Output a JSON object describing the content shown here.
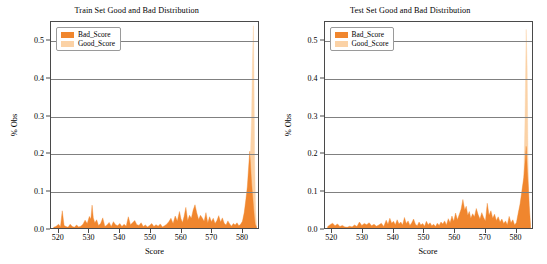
{
  "figure": {
    "width": 547,
    "height": 264,
    "background": "#ffffff"
  },
  "colors": {
    "bad_score": "#f0862e",
    "good_score": "#fbd2a6",
    "grid": "#808080",
    "axis": "#4a4a4a",
    "text": "#000000"
  },
  "panels": [
    {
      "id": "train",
      "title": "Train Set Good and Bad Distribution",
      "legend": {
        "bad_label": "Bad_Score",
        "good_label": "Good_Score"
      },
      "xlabel": "Score",
      "ylabel": "% Obs",
      "xticks": [
        "520",
        "530",
        "540",
        "550",
        "560",
        "570",
        "580"
      ],
      "yticks": [
        "0.0",
        "0.1",
        "0.2",
        "0.3",
        "0.4",
        "0.5"
      ]
    },
    {
      "id": "test",
      "title": "Test Set Good and Bad Distribution",
      "legend": {
        "bad_label": "Bad_Score",
        "good_label": "Good_Score"
      },
      "xlabel": "Score",
      "ylabel": "% Obs",
      "xticks": [
        "520",
        "530",
        "540",
        "550",
        "560",
        "570",
        "580"
      ],
      "yticks": [
        "0.0",
        "0.1",
        "0.2",
        "0.3",
        "0.4",
        "0.5"
      ]
    }
  ],
  "chart_data": [
    {
      "type": "line",
      "id": "train",
      "title": "Train Set Good and Bad Distribution",
      "xlabel": "Score",
      "ylabel": "% Obs",
      "xlim": [
        517.5,
        585.5
      ],
      "ylim": [
        0.0,
        0.55
      ],
      "grid": true,
      "grid_axis": "y",
      "legend_position": "upper left",
      "yticks": [
        0.0,
        0.1,
        0.2,
        0.3,
        0.4,
        0.5
      ],
      "xticks": [
        520,
        530,
        540,
        550,
        560,
        570,
        580
      ],
      "series": [
        {
          "name": "Bad_Score",
          "color": "#f0862e",
          "x": [
            518.4,
            519.1,
            520.0,
            520.6,
            521.2,
            521.8,
            522.4,
            523.1,
            523.8,
            524.5,
            525.2,
            525.9,
            526.6,
            527.3,
            528.0,
            528.7,
            529.4,
            530.1,
            530.6,
            531.0,
            531.4,
            531.9,
            532.5,
            533.1,
            533.8,
            534.5,
            535.2,
            535.9,
            536.6,
            537.3,
            538.0,
            538.7,
            539.4,
            540.1,
            540.8,
            541.5,
            542.2,
            542.9,
            543.6,
            544.3,
            545.0,
            545.7,
            546.4,
            547.1,
            547.8,
            548.5,
            549.2,
            549.9,
            550.6,
            551.3,
            552.0,
            552.7,
            553.4,
            554.1,
            554.8,
            555.5,
            556.2,
            556.9,
            557.6,
            558.3,
            559.0,
            559.7,
            560.2,
            560.7,
            561.2,
            561.8,
            562.4,
            563.0,
            563.6,
            564.2,
            564.8,
            565.4,
            566.0,
            566.6,
            567.2,
            567.8,
            568.4,
            569.0,
            569.6,
            570.2,
            570.8,
            571.4,
            572.0,
            572.6,
            573.2,
            573.8,
            574.4,
            575.0,
            575.6,
            576.2,
            576.8,
            577.4,
            578.0,
            578.6,
            579.2,
            579.8,
            580.4,
            581.0,
            581.5,
            582.0,
            582.4,
            582.8,
            583.1,
            583.4,
            583.7,
            584.0,
            584.3,
            584.6,
            585.0
          ],
          "y": [
            0.002,
            0.004,
            0.01,
            0.003,
            0.046,
            0.007,
            0.004,
            0.002,
            0.01,
            0.004,
            0.002,
            0.008,
            0.003,
            0.005,
            0.01,
            0.021,
            0.012,
            0.031,
            0.024,
            0.061,
            0.027,
            0.014,
            0.022,
            0.007,
            0.012,
            0.027,
            0.004,
            0.008,
            0.015,
            0.004,
            0.017,
            0.009,
            0.006,
            0.012,
            0.004,
            0.01,
            0.005,
            0.03,
            0.009,
            0.014,
            0.02,
            0.009,
            0.007,
            0.014,
            0.004,
            0.008,
            0.003,
            0.007,
            0.012,
            0.004,
            0.009,
            0.005,
            0.011,
            0.003,
            0.006,
            0.01,
            0.017,
            0.026,
            0.012,
            0.032,
            0.019,
            0.044,
            0.025,
            0.015,
            0.03,
            0.055,
            0.02,
            0.034,
            0.026,
            0.048,
            0.062,
            0.04,
            0.023,
            0.034,
            0.027,
            0.018,
            0.041,
            0.014,
            0.03,
            0.017,
            0.026,
            0.012,
            0.02,
            0.033,
            0.016,
            0.027,
            0.013,
            0.008,
            0.019,
            0.011,
            0.005,
            0.012,
            0.008,
            0.014,
            0.006,
            0.01,
            0.018,
            0.042,
            0.075,
            0.11,
            0.16,
            0.205,
            0.16,
            0.12,
            0.09,
            0.06,
            0.03,
            0.01,
            0.003
          ]
        },
        {
          "name": "Good_Score",
          "color": "#fbd2a6",
          "x": [
            518.4,
            519.1,
            520.0,
            520.6,
            521.2,
            521.8,
            522.4,
            523.1,
            523.8,
            524.5,
            525.2,
            525.9,
            526.6,
            527.3,
            528.0,
            528.7,
            529.4,
            530.1,
            530.6,
            531.0,
            531.4,
            531.9,
            532.5,
            533.1,
            533.8,
            534.5,
            535.2,
            535.9,
            536.6,
            537.3,
            538.0,
            538.7,
            539.4,
            540.1,
            540.8,
            541.5,
            542.2,
            542.9,
            543.6,
            544.3,
            545.0,
            545.7,
            546.4,
            547.1,
            547.8,
            548.5,
            549.2,
            549.9,
            550.6,
            551.3,
            552.0,
            552.7,
            553.4,
            554.1,
            554.8,
            555.5,
            556.2,
            556.9,
            557.6,
            558.3,
            559.0,
            559.7,
            560.2,
            560.7,
            561.2,
            561.8,
            562.4,
            563.0,
            563.6,
            564.2,
            564.8,
            565.4,
            566.0,
            566.6,
            567.2,
            567.8,
            568.4,
            569.0,
            569.6,
            570.2,
            570.8,
            571.4,
            572.0,
            572.6,
            573.2,
            573.8,
            574.4,
            575.0,
            575.6,
            576.2,
            576.8,
            577.4,
            578.0,
            578.6,
            579.2,
            579.8,
            580.4,
            581.0,
            581.6,
            582.1,
            582.6,
            583.0,
            583.4,
            583.7,
            584.0,
            584.2,
            584.4,
            584.7,
            585.0
          ],
          "y": [
            0.001,
            0.002,
            0.005,
            0.002,
            0.018,
            0.004,
            0.002,
            0.001,
            0.005,
            0.002,
            0.001,
            0.004,
            0.002,
            0.003,
            0.005,
            0.009,
            0.006,
            0.013,
            0.01,
            0.022,
            0.011,
            0.007,
            0.009,
            0.004,
            0.006,
            0.011,
            0.002,
            0.004,
            0.007,
            0.002,
            0.008,
            0.004,
            0.003,
            0.006,
            0.002,
            0.005,
            0.003,
            0.012,
            0.004,
            0.007,
            0.009,
            0.004,
            0.003,
            0.007,
            0.002,
            0.004,
            0.002,
            0.003,
            0.006,
            0.002,
            0.004,
            0.003,
            0.005,
            0.002,
            0.003,
            0.005,
            0.008,
            0.012,
            0.006,
            0.015,
            0.009,
            0.02,
            0.012,
            0.008,
            0.014,
            0.024,
            0.01,
            0.016,
            0.012,
            0.021,
            0.028,
            0.018,
            0.011,
            0.016,
            0.013,
            0.009,
            0.019,
            0.007,
            0.014,
            0.009,
            0.013,
            0.007,
            0.011,
            0.017,
            0.009,
            0.014,
            0.008,
            0.005,
            0.011,
            0.007,
            0.004,
            0.008,
            0.006,
            0.01,
            0.005,
            0.009,
            0.016,
            0.038,
            0.07,
            0.105,
            0.145,
            0.19,
            0.3,
            0.45,
            0.54,
            0.38,
            0.18,
            0.05,
            0.005
          ]
        }
      ],
      "annotations": [
        "Tall narrow spike near score 584 exceeding the 0.5 axis limit",
        "Secondary peak around 0.21 near score 583",
        "Low sparse activity below 0.07 across 518-580"
      ]
    },
    {
      "type": "line",
      "id": "test",
      "title": "Test Set Good and Bad Distribution",
      "xlabel": "Score",
      "ylabel": "% Obs",
      "xlim": [
        517.5,
        585.5
      ],
      "ylim": [
        0.0,
        0.55
      ],
      "grid": true,
      "grid_axis": "y",
      "legend_position": "upper left",
      "yticks": [
        0.0,
        0.1,
        0.2,
        0.3,
        0.4,
        0.5
      ],
      "xticks": [
        520,
        530,
        540,
        550,
        560,
        570,
        580
      ],
      "series": [
        {
          "name": "Bad_Score",
          "color": "#f0862e",
          "x": [
            518.4,
            519.2,
            520.0,
            520.8,
            521.6,
            522.4,
            523.2,
            524.0,
            524.8,
            525.6,
            526.4,
            527.2,
            528.0,
            528.8,
            529.6,
            530.4,
            531.2,
            532.0,
            532.8,
            533.6,
            534.4,
            535.2,
            536.0,
            536.8,
            537.6,
            538.2,
            538.8,
            539.4,
            540.0,
            540.6,
            541.2,
            541.8,
            542.4,
            543.0,
            543.6,
            544.2,
            544.8,
            545.4,
            546.0,
            546.6,
            547.2,
            547.8,
            548.4,
            549.0,
            549.6,
            550.2,
            550.8,
            551.4,
            552.0,
            552.6,
            553.2,
            553.8,
            554.4,
            555.0,
            555.6,
            556.2,
            556.8,
            557.4,
            558.0,
            558.6,
            559.2,
            559.8,
            560.4,
            561.0,
            561.6,
            562.2,
            562.8,
            563.4,
            563.9,
            564.4,
            564.9,
            565.4,
            566.0,
            566.6,
            567.2,
            567.8,
            568.4,
            569.0,
            569.6,
            570.2,
            570.8,
            571.4,
            572.0,
            572.6,
            573.2,
            573.8,
            574.4,
            575.0,
            575.6,
            576.2,
            576.8,
            577.4,
            578.0,
            578.6,
            579.2,
            579.8,
            580.4,
            581.0,
            581.6,
            582.2,
            582.8,
            583.2,
            583.6,
            584.0,
            584.3,
            584.6,
            585.0
          ],
          "y": [
            0.004,
            0.009,
            0.013,
            0.006,
            0.011,
            0.004,
            0.007,
            0.003,
            0.002,
            0.005,
            0.003,
            0.008,
            0.004,
            0.016,
            0.007,
            0.012,
            0.009,
            0.014,
            0.006,
            0.01,
            0.005,
            0.008,
            0.013,
            0.004,
            0.021,
            0.01,
            0.026,
            0.013,
            0.018,
            0.009,
            0.022,
            0.011,
            0.016,
            0.008,
            0.028,
            0.012,
            0.019,
            0.007,
            0.014,
            0.024,
            0.01,
            0.006,
            0.016,
            0.008,
            0.012,
            0.005,
            0.018,
            0.009,
            0.014,
            0.006,
            0.01,
            0.004,
            0.013,
            0.007,
            0.016,
            0.011,
            0.019,
            0.008,
            0.025,
            0.014,
            0.032,
            0.018,
            0.04,
            0.022,
            0.036,
            0.05,
            0.076,
            0.048,
            0.058,
            0.034,
            0.044,
            0.026,
            0.038,
            0.03,
            0.052,
            0.036,
            0.024,
            0.041,
            0.028,
            0.019,
            0.066,
            0.034,
            0.046,
            0.026,
            0.037,
            0.02,
            0.03,
            0.016,
            0.024,
            0.012,
            0.019,
            0.009,
            0.031,
            0.014,
            0.022,
            0.008,
            0.015,
            0.041,
            0.065,
            0.1,
            0.135,
            0.175,
            0.218,
            0.15,
            0.11,
            0.06,
            0.01
          ]
        },
        {
          "name": "Good_Score",
          "color": "#fbd2a6",
          "x": [
            518.4,
            519.2,
            520.0,
            520.8,
            521.6,
            522.4,
            523.2,
            524.0,
            524.8,
            525.6,
            526.4,
            527.2,
            528.0,
            528.8,
            529.6,
            530.4,
            531.2,
            532.0,
            532.8,
            533.6,
            534.4,
            535.2,
            536.0,
            536.8,
            537.6,
            538.2,
            538.8,
            539.4,
            540.0,
            540.6,
            541.2,
            541.8,
            542.4,
            543.0,
            543.6,
            544.2,
            544.8,
            545.4,
            546.0,
            546.6,
            547.2,
            547.8,
            548.4,
            549.0,
            549.6,
            550.2,
            550.8,
            551.4,
            552.0,
            552.6,
            553.2,
            553.8,
            554.4,
            555.0,
            555.6,
            556.2,
            556.8,
            557.4,
            558.0,
            558.6,
            559.2,
            559.8,
            560.4,
            561.0,
            561.6,
            562.2,
            562.8,
            563.4,
            563.9,
            564.4,
            564.9,
            565.4,
            566.0,
            566.6,
            567.2,
            567.8,
            568.4,
            569.0,
            569.6,
            570.2,
            570.8,
            571.4,
            572.0,
            572.6,
            573.2,
            573.8,
            574.4,
            575.0,
            575.6,
            576.2,
            576.8,
            577.4,
            578.0,
            578.6,
            579.2,
            579.8,
            580.4,
            581.0,
            581.6,
            582.2,
            582.8,
            583.2,
            583.6,
            583.9,
            584.2,
            584.5,
            585.0
          ],
          "y": [
            0.002,
            0.004,
            0.006,
            0.003,
            0.005,
            0.002,
            0.003,
            0.002,
            0.001,
            0.002,
            0.002,
            0.004,
            0.002,
            0.007,
            0.003,
            0.005,
            0.004,
            0.007,
            0.003,
            0.005,
            0.002,
            0.004,
            0.006,
            0.002,
            0.01,
            0.005,
            0.012,
            0.006,
            0.008,
            0.004,
            0.01,
            0.005,
            0.007,
            0.004,
            0.013,
            0.006,
            0.009,
            0.003,
            0.007,
            0.011,
            0.005,
            0.003,
            0.008,
            0.004,
            0.006,
            0.002,
            0.008,
            0.004,
            0.007,
            0.003,
            0.005,
            0.002,
            0.006,
            0.003,
            0.008,
            0.005,
            0.009,
            0.004,
            0.012,
            0.007,
            0.015,
            0.009,
            0.019,
            0.011,
            0.017,
            0.024,
            0.036,
            0.022,
            0.027,
            0.016,
            0.021,
            0.012,
            0.018,
            0.014,
            0.025,
            0.017,
            0.011,
            0.02,
            0.013,
            0.009,
            0.031,
            0.016,
            0.022,
            0.012,
            0.018,
            0.01,
            0.014,
            0.008,
            0.012,
            0.006,
            0.009,
            0.004,
            0.015,
            0.007,
            0.011,
            0.004,
            0.008,
            0.036,
            0.06,
            0.095,
            0.13,
            0.29,
            0.53,
            0.43,
            0.19,
            0.04,
            0.004
          ]
        }
      ],
      "annotations": [
        "Very tall narrow spike near score 584 exceeding the 0.5 axis limit",
        "Secondary peak reaching about 0.22 just before 584",
        "Broad low-level activity peaking near 0.076 around score 563"
      ]
    }
  ]
}
